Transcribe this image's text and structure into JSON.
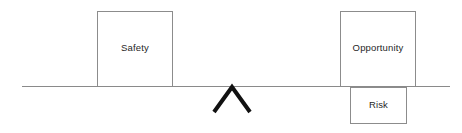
{
  "diagram": {
    "background_color": "#ffffff",
    "line_color": "#8a8a8a",
    "box_border_color": "#8c8c8c",
    "fulcrum_color": "#111111",
    "text_color": "#1f1f1f",
    "lever": {
      "name": "balance-beam",
      "x1": 22,
      "y1": 86.5,
      "x2": 450,
      "y2": 86.5
    },
    "fulcrum": {
      "name": "fulcrum-chevron",
      "apex_x": 232,
      "apex_y": 87,
      "left_x": 214,
      "left_y": 112,
      "right_x": 250,
      "right_y": 112,
      "stroke_width": 4
    },
    "boxes": [
      {
        "id": "safety",
        "label": "Safety",
        "x": 97,
        "y": 11,
        "width": 76,
        "height": 76,
        "side": "left"
      },
      {
        "id": "opportunity",
        "label": "Opportunity",
        "x": 340,
        "y": 11,
        "width": 76,
        "height": 76,
        "side": "right-above"
      },
      {
        "id": "risk",
        "label": "Risk",
        "x": 350,
        "y": 87,
        "width": 57,
        "height": 37,
        "side": "right-below"
      }
    ]
  }
}
